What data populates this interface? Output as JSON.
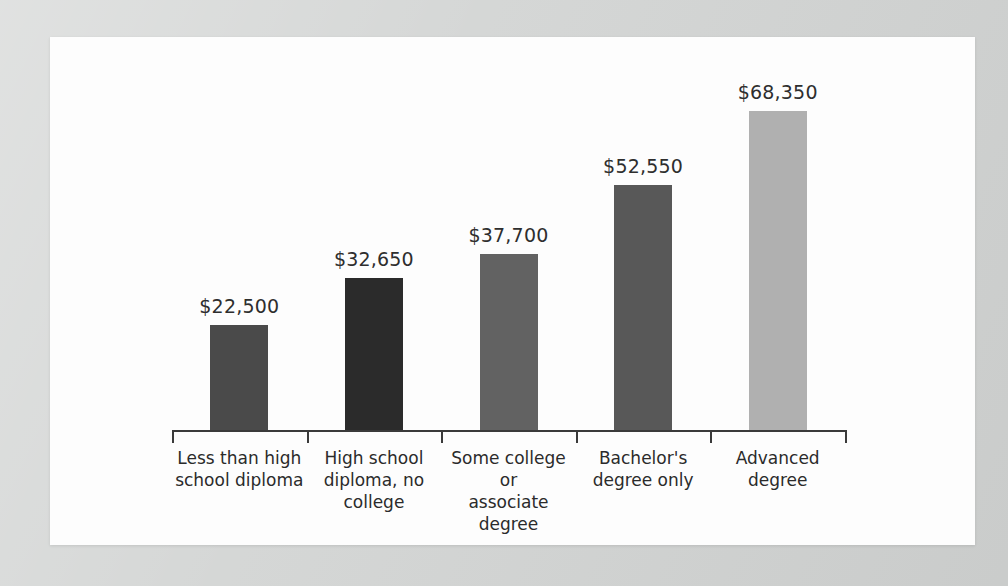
{
  "chart_data": {
    "type": "bar",
    "title": "",
    "subtitle": "",
    "xlabel": "",
    "ylabel": "",
    "grid": false,
    "legend": false,
    "ylim": [
      0,
      75000
    ],
    "axis_baseline_value": 0,
    "categories": [
      "Less than high school diploma",
      "High school diploma, no college",
      "Some college or associate degree",
      "Bachelor's degree only",
      "Advanced degree"
    ],
    "category_label_lines": [
      [
        "Less than high",
        "school diploma"
      ],
      [
        "High school",
        "diploma, no",
        "college"
      ],
      [
        "Some college or",
        "associate",
        "degree"
      ],
      [
        "Bachelor's",
        "degree only"
      ],
      [
        "Advanced",
        "degree"
      ]
    ],
    "values": [
      22500,
      32650,
      37700,
      52550,
      68350
    ],
    "value_labels": [
      "$22,500",
      "$32,650",
      "$37,700",
      "$52,550",
      "$68,350"
    ],
    "bar_colors": [
      "#4a4a4a",
      "#2b2b2b",
      "#626262",
      "#585858",
      "#b0b0b0"
    ]
  },
  "page": {
    "background_color": "#d3d5d4",
    "panel_color": "#fdfdfd",
    "axis_color": "#3a3a3a",
    "text_color": "#2b2b2b"
  }
}
